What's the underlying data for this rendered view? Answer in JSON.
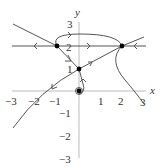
{
  "diagram": {
    "type": "phase-portrait",
    "axes": {
      "x_label": "x",
      "y_label": "y",
      "x_ticks": [
        "−3",
        "−2",
        "−1",
        "1",
        "2",
        "3"
      ],
      "y_ticks": [
        "3",
        "2",
        "1",
        "−1",
        "−2",
        "−3"
      ],
      "x_range": [
        -3,
        3
      ],
      "y_range": [
        -3,
        3
      ]
    },
    "equilibria": [
      {
        "label": "(0,0)",
        "x": 0,
        "y": 0
      },
      {
        "label": "(0,1)",
        "x": 0,
        "y": 1
      },
      {
        "label": "(−1,2)",
        "x": -1,
        "y": 2
      },
      {
        "label": "(2,2)",
        "x": 2,
        "y": 2
      }
    ],
    "colors": {
      "axis": "#999999",
      "curve": "#555555",
      "point": "#000000"
    }
  }
}
